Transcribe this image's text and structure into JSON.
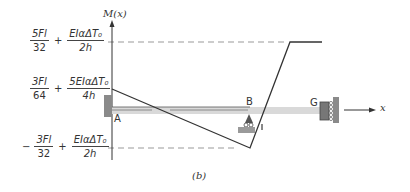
{
  "diagram": {
    "axis_y_label": "M(x)",
    "axis_x_label": "x",
    "caption": "(b)",
    "nodes": {
      "A": "A",
      "B": "B",
      "G": "G"
    },
    "levels": [
      {
        "id": "top",
        "num1": "5Fl",
        "den1": "32",
        "sign": "+",
        "num2": "EIαΔT₀",
        "den2": "2h",
        "prefix": ""
      },
      {
        "id": "start",
        "num1": "3Fl",
        "den1": "64",
        "sign": "+",
        "num2": "5EIαΔT₀",
        "den2": "4h",
        "prefix": ""
      },
      {
        "id": "bottom",
        "num1": "3Fl",
        "den1": "32",
        "sign": "+",
        "num2": "EIαΔT₀",
        "den2": "2h",
        "prefix": "−"
      }
    ],
    "colors": {
      "line": "#333333",
      "dash": "#999999",
      "beam": "#d9d9d9",
      "hatch": "#8a8a8a"
    }
  }
}
